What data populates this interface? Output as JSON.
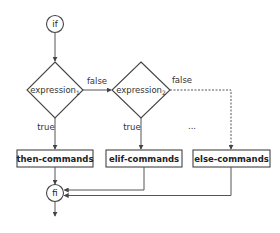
{
  "diagram": {
    "type": "flowchart",
    "title": "",
    "nodes": {
      "start": {
        "label": "if",
        "shape": "circle"
      },
      "cond1": {
        "label": "expression",
        "subscript": "1",
        "shape": "diamond"
      },
      "cond2": {
        "label": "expression",
        "subscript": "2",
        "shape": "diamond"
      },
      "then": {
        "label": "then-commands",
        "shape": "box"
      },
      "elif": {
        "label": "elif-commands",
        "shape": "box"
      },
      "else": {
        "label": "else-commands",
        "shape": "box"
      },
      "end": {
        "label": "fi",
        "shape": "circle"
      }
    },
    "edges": {
      "cond1_false": "false",
      "cond2_false": "false",
      "cond1_true": "true",
      "cond2_true": "true",
      "ellipsis": "..."
    },
    "colors": {
      "stroke": "#444444",
      "text": "#222222",
      "background": "#ffffff"
    }
  }
}
